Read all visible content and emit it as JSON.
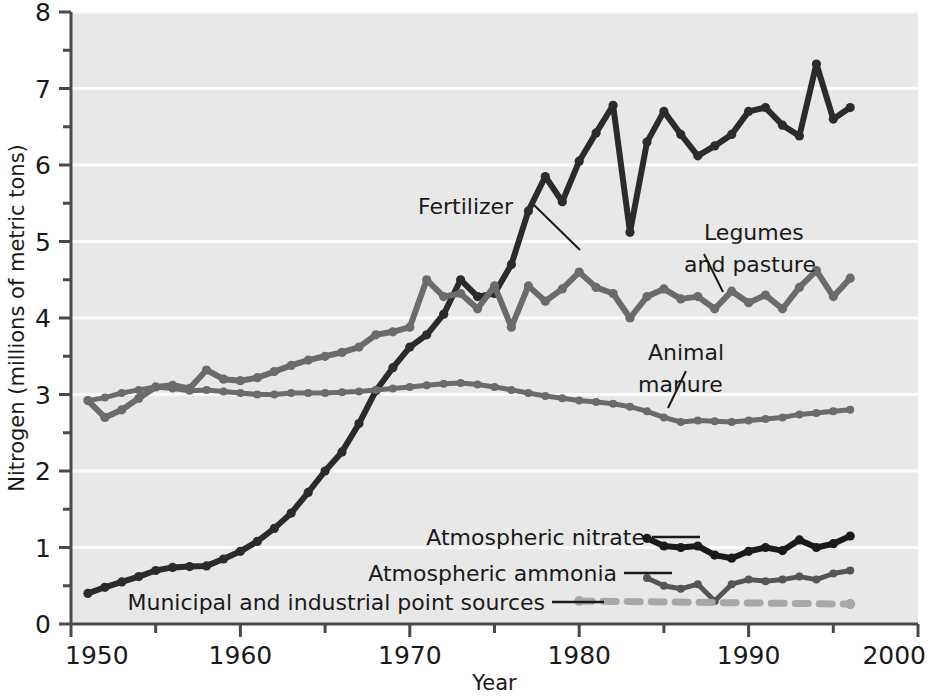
{
  "chart_data": {
    "type": "line",
    "title": "",
    "xlabel": "Year",
    "ylabel": "Nitrogen (millions of metric tons)",
    "xlim": [
      1950,
      2000
    ],
    "ylim": [
      0,
      8
    ],
    "x_major_ticks": [
      1950,
      1960,
      1970,
      1980,
      1990,
      2000
    ],
    "x_minor_ticks": [
      1955,
      1965,
      1975,
      1985,
      1995
    ],
    "y_major_ticks": [
      0,
      1,
      2,
      3,
      4,
      5,
      6,
      7,
      8
    ],
    "y_minor_ticks": [
      0.5,
      1.5,
      2.5,
      3.5,
      4.5,
      5.5,
      6.5,
      7.5
    ],
    "x_tick_labels": [
      "1950",
      "1960",
      "1970",
      "1980",
      "1990",
      "2000"
    ],
    "y_tick_labels": [
      "0",
      "1",
      "2",
      "3",
      "4",
      "5",
      "6",
      "7",
      "8"
    ],
    "grid": "horizontal-white-at-integers",
    "legend": "inline-annotations-with-leader-lines",
    "markers": "filled-circles-at-each-year",
    "series": [
      {
        "name": "Fertilizer",
        "color": "#2b2b2b",
        "style": "solid",
        "x": [
          1951,
          1952,
          1953,
          1954,
          1955,
          1956,
          1957,
          1958,
          1959,
          1960,
          1961,
          1962,
          1963,
          1964,
          1965,
          1966,
          1967,
          1968,
          1969,
          1970,
          1971,
          1972,
          1973,
          1974,
          1975,
          1976,
          1977,
          1978,
          1979,
          1980,
          1981,
          1982,
          1983,
          1984,
          1985,
          1986,
          1987,
          1988,
          1989,
          1990,
          1991,
          1992,
          1993,
          1994,
          1995,
          1996
        ],
        "values": [
          0.4,
          0.48,
          0.55,
          0.62,
          0.7,
          0.74,
          0.75,
          0.76,
          0.85,
          0.95,
          1.08,
          1.25,
          1.45,
          1.72,
          2.0,
          2.25,
          2.62,
          3.05,
          3.35,
          3.62,
          3.78,
          4.05,
          4.5,
          4.28,
          4.32,
          4.7,
          5.4,
          5.85,
          5.52,
          6.05,
          6.42,
          6.78,
          5.12,
          6.3,
          6.7,
          6.4,
          6.12,
          6.25,
          6.4,
          6.7,
          6.75,
          6.52,
          6.38,
          7.32,
          6.6,
          6.75
        ]
      },
      {
        "name": "Legumes and pasture",
        "color": "#6b6b6b",
        "style": "solid",
        "x": [
          1951,
          1952,
          1953,
          1954,
          1955,
          1956,
          1957,
          1958,
          1959,
          1960,
          1961,
          1962,
          1963,
          1964,
          1965,
          1966,
          1967,
          1968,
          1969,
          1970,
          1971,
          1972,
          1973,
          1974,
          1975,
          1976,
          1977,
          1978,
          1979,
          1980,
          1981,
          1982,
          1983,
          1984,
          1985,
          1986,
          1987,
          1988,
          1989,
          1990,
          1991,
          1992,
          1993,
          1994,
          1995,
          1996
        ],
        "values": [
          2.92,
          2.7,
          2.8,
          2.95,
          3.1,
          3.12,
          3.08,
          3.32,
          3.2,
          3.18,
          3.22,
          3.3,
          3.38,
          3.45,
          3.5,
          3.55,
          3.62,
          3.78,
          3.82,
          3.88,
          4.5,
          4.28,
          4.32,
          4.12,
          4.42,
          3.88,
          4.42,
          4.22,
          4.38,
          4.6,
          4.4,
          4.32,
          4.0,
          4.28,
          4.38,
          4.25,
          4.28,
          4.12,
          4.35,
          4.2,
          4.3,
          4.12,
          4.4,
          4.62,
          4.28,
          4.52
        ]
      },
      {
        "name": "Animal manure",
        "color": "#6b6b6b",
        "style": "solid",
        "x": [
          1951,
          1952,
          1953,
          1954,
          1955,
          1956,
          1957,
          1958,
          1959,
          1960,
          1961,
          1962,
          1963,
          1964,
          1965,
          1966,
          1967,
          1968,
          1969,
          1970,
          1971,
          1972,
          1973,
          1974,
          1975,
          1976,
          1977,
          1978,
          1979,
          1980,
          1981,
          1982,
          1983,
          1984,
          1985,
          1986,
          1987,
          1988,
          1989,
          1990,
          1991,
          1992,
          1993,
          1994,
          1995,
          1996
        ],
        "values": [
          2.92,
          2.96,
          3.02,
          3.06,
          3.1,
          3.08,
          3.05,
          3.06,
          3.04,
          3.02,
          3.0,
          3.0,
          3.02,
          3.02,
          3.02,
          3.03,
          3.04,
          3.06,
          3.08,
          3.1,
          3.12,
          3.14,
          3.15,
          3.13,
          3.1,
          3.06,
          3.02,
          2.98,
          2.95,
          2.92,
          2.9,
          2.88,
          2.84,
          2.78,
          2.7,
          2.64,
          2.66,
          2.65,
          2.64,
          2.66,
          2.68,
          2.7,
          2.74,
          2.76,
          2.78,
          2.8
        ]
      },
      {
        "name": "Atmospheric nitrate",
        "color": "#1a1a1a",
        "style": "solid",
        "x": [
          1984,
          1985,
          1986,
          1987,
          1988,
          1989,
          1990,
          1991,
          1992,
          1993,
          1994,
          1995,
          1996
        ],
        "values": [
          1.12,
          1.02,
          1.0,
          1.02,
          0.9,
          0.86,
          0.95,
          1.0,
          0.96,
          1.1,
          1.0,
          1.05,
          1.15
        ]
      },
      {
        "name": "Atmospheric ammonia",
        "color": "#555555",
        "style": "solid",
        "x": [
          1984,
          1985,
          1986,
          1987,
          1988,
          1989,
          1990,
          1991,
          1992,
          1993,
          1994,
          1995,
          1996
        ],
        "values": [
          0.6,
          0.5,
          0.46,
          0.52,
          0.3,
          0.52,
          0.58,
          0.56,
          0.58,
          0.62,
          0.58,
          0.66,
          0.7
        ]
      },
      {
        "name": "Municipal and industrial point sources",
        "color": "#a8a8a8",
        "style": "dashed",
        "x": [
          1980,
          1996
        ],
        "values": [
          0.3,
          0.26
        ]
      }
    ],
    "annotations": [
      {
        "name": "Fertilizer",
        "text": "Fertilizer"
      },
      {
        "name": "Legumes and pasture",
        "line1": "Legumes",
        "line2": "and pasture"
      },
      {
        "name": "Animal manure",
        "line1": "Animal",
        "line2": "manure"
      },
      {
        "name": "Atmospheric nitrate",
        "text": "Atmospheric nitrate"
      },
      {
        "name": "Atmospheric ammonia",
        "text": "Atmospheric ammonia"
      },
      {
        "name": "Municipal and industrial point sources",
        "text": "Municipal and industrial point sources"
      }
    ]
  },
  "axes": {
    "ylabel": "Nitrogen (millions of metric tons)",
    "xlabel": "Year",
    "y_ticks": [
      "0",
      "1",
      "2",
      "3",
      "4",
      "5",
      "6",
      "7",
      "8"
    ],
    "x_ticks": [
      "1950",
      "1960",
      "1970",
      "1980",
      "1990",
      "2000"
    ]
  },
  "annotations": {
    "fertilizer": "Fertilizer",
    "legumes_l1": "Legumes",
    "legumes_l2": "and pasture",
    "manure_l1": "Animal",
    "manure_l2": "manure",
    "nitrate": "Atmospheric nitrate",
    "ammonia": "Atmospheric ammonia",
    "municipal": "Municipal and industrial point sources"
  },
  "colors": {
    "plot_background": "#e8e8e8",
    "gridline": "#fbfbfb",
    "axis": "#4a4a4a",
    "fertilizer": "#2b2b2b",
    "legumes": "#6b6b6b",
    "manure": "#6b6b6b",
    "nitrate": "#1a1a1a",
    "ammonia": "#555555",
    "municipal": "#a8a8a8"
  }
}
